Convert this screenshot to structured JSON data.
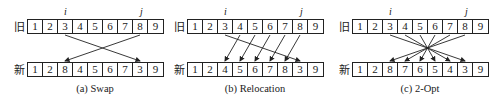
{
  "row_labels": {
    "old": "旧",
    "new": "新"
  },
  "index_labels": {
    "i": "i",
    "j": "j"
  },
  "panels": [
    {
      "id": "swap",
      "caption": "(a) Swap",
      "old": [
        "1",
        "2",
        "3",
        "4",
        "5",
        "6",
        "7",
        "8",
        "9"
      ],
      "new": [
        "1",
        "2",
        "8",
        "4",
        "5",
        "6",
        "7",
        "3",
        "9"
      ],
      "i_index": 2,
      "j_index": 7,
      "moves": [
        [
          2,
          7
        ],
        [
          7,
          2
        ]
      ]
    },
    {
      "id": "relocation",
      "caption": "(b) Relocation",
      "old": [
        "1",
        "2",
        "3",
        "4",
        "5",
        "6",
        "7",
        "8",
        "9"
      ],
      "new": [
        "1",
        "2",
        "4",
        "5",
        "6",
        "7",
        "8",
        "3",
        "9"
      ],
      "i_index": 2,
      "j_index": 7,
      "moves": [
        [
          2,
          7
        ],
        [
          3,
          2
        ],
        [
          4,
          3
        ],
        [
          5,
          4
        ],
        [
          6,
          5
        ],
        [
          7,
          6
        ]
      ]
    },
    {
      "id": "two-opt",
      "caption": "(c) 2-Opt",
      "old": [
        "1",
        "2",
        "3",
        "4",
        "5",
        "6",
        "7",
        "8",
        "9"
      ],
      "new": [
        "1",
        "2",
        "8",
        "7",
        "6",
        "5",
        "4",
        "3",
        "9"
      ],
      "i_index": 2,
      "j_index": 7,
      "moves": [
        [
          2,
          7
        ],
        [
          3,
          6
        ],
        [
          4,
          5
        ],
        [
          5,
          4
        ],
        [
          6,
          3
        ],
        [
          7,
          2
        ]
      ]
    }
  ],
  "colors": {
    "stroke": "#222222",
    "text": "#1a1a1a",
    "background": "#ffffff"
  }
}
